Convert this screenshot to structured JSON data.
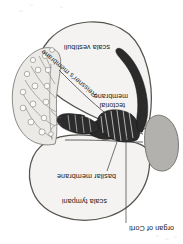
{
  "figure": {
    "name": "cochlear-duct-cross-section",
    "orientation_note": "plate printed upside down (rotated 180 degrees)",
    "background_color": "#ffffff",
    "outline_color": "#55544f",
    "interior_fill": "#f4f3f1",
    "organ_color": "#2c2c2c",
    "stria_color": "#b2b1ad",
    "text_color": "#1b1b1b"
  },
  "labels": {
    "organ_of_corti": "organ of Corti",
    "scala_tympani": "scala tympani",
    "basilar_membrane": "basilar membrane",
    "tectorial_membrane_line1": "tectorial",
    "tectorial_membrane_line2": "membrane",
    "reissners_membrane": "Reissner's membrane",
    "scala_vestibuli": "scala vestibuli"
  }
}
